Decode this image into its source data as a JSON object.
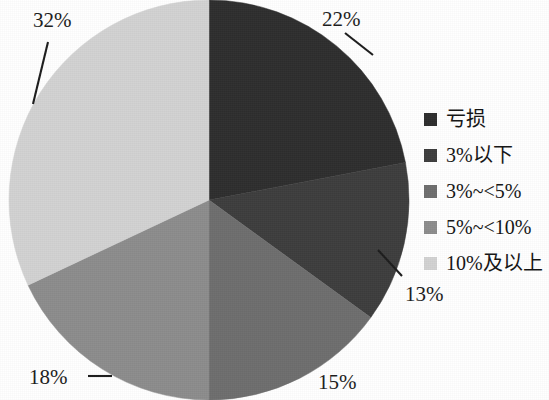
{
  "chart_data": {
    "type": "pie",
    "title": "",
    "subtitle": "",
    "xlabel": "",
    "ylabel": "",
    "legend_position": "right",
    "grid": false,
    "start_angle_deg": 0,
    "direction": "clockwise",
    "categories": [
      "亏损",
      "3%以下",
      "3%~<5%",
      "5%~<10%",
      "10%及以上"
    ],
    "values": [
      22,
      13,
      15,
      18,
      32
    ],
    "value_labels": [
      "22%",
      "13%",
      "15%",
      "18%",
      "32%"
    ],
    "colors": [
      "#2e2e2e",
      "#3d3d3d",
      "#6e6e6e",
      "#8c8c8c",
      "#d2d2d2"
    ],
    "slices": [
      {
        "label": "亏损",
        "value": 22,
        "display": "22%",
        "color": "#2e2e2e"
      },
      {
        "label": "3%以下",
        "value": 13,
        "display": "13%",
        "color": "#3d3d3d"
      },
      {
        "label": "3%~<5%",
        "value": 15,
        "display": "15%",
        "color": "#6e6e6e"
      },
      {
        "label": "5%~<10%",
        "value": 18,
        "display": "18%",
        "color": "#8c8c8c"
      },
      {
        "label": "10%及以上",
        "value": 32,
        "display": "32%",
        "color": "#d2d2d2"
      }
    ]
  },
  "labels": {
    "pct_32": "32%",
    "pct_22": "22%",
    "pct_13": "13%",
    "pct_15": "15%",
    "pct_18": "18%"
  },
  "legend": {
    "items": [
      {
        "label": "亏损",
        "color": "#2e2e2e"
      },
      {
        "label": "3%以下",
        "color": "#3d3d3d"
      },
      {
        "label": "3%~<5%",
        "color": "#6e6e6e"
      },
      {
        "label": "5%~<10%",
        "color": "#8c8c8c"
      },
      {
        "label": "10%及以上",
        "color": "#d2d2d2"
      }
    ]
  }
}
